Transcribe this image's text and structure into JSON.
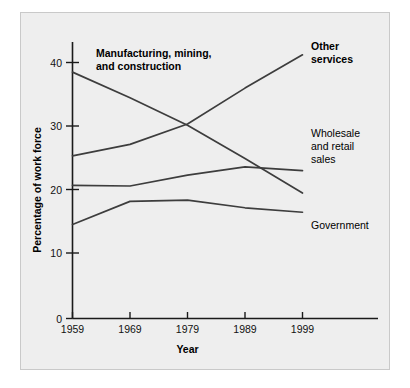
{
  "chart_data": {
    "type": "line",
    "title": "",
    "xlabel": "Year",
    "ylabel": "Percentage of work force",
    "categories": [
      "1959",
      "1969",
      "1979",
      "1989",
      "1999"
    ],
    "x": [
      1959,
      1969,
      1979,
      1989,
      1999
    ],
    "xlim": [
      1959,
      1999
    ],
    "ylim": [
      0,
      43
    ],
    "grid": false,
    "legend_position": "inline-annotations",
    "yticks": [
      "0",
      "10",
      "20",
      "30",
      "40"
    ],
    "ytick_values": [
      0,
      10,
      20,
      30,
      40
    ],
    "xticks": [
      "1959",
      "1969",
      "1979",
      "1989",
      "1999"
    ],
    "series": [
      {
        "name": "Manufacturing, mining, and construction",
        "label_bold": true,
        "values": [
          38.5,
          34.5,
          30.2,
          25.0,
          19.6
        ]
      },
      {
        "name": "Other services",
        "label_bold": true,
        "values": [
          25.4,
          27.2,
          30.4,
          36.0,
          41.2
        ]
      },
      {
        "name": "Wholesale and retail sales",
        "label_bold": false,
        "values": [
          20.8,
          20.7,
          22.4,
          23.7,
          23.1
        ]
      },
      {
        "name": "Government",
        "label_bold": false,
        "values": [
          14.7,
          18.3,
          18.5,
          17.3,
          16.6
        ]
      }
    ],
    "annotations": [
      {
        "id": "manufacturing",
        "line1": "Manufacturing, mining,",
        "line2": "and construction",
        "bold": true
      },
      {
        "id": "other-services",
        "line1": "Other",
        "line2": "services",
        "bold": true
      },
      {
        "id": "wholesale",
        "line1": "Wholesale",
        "line2": "and retail",
        "line3": "sales",
        "bold": false
      },
      {
        "id": "government",
        "line1": "Government",
        "bold": false
      }
    ],
    "colors": {
      "line": "#3d3d3d",
      "axis": "#1a1a1a",
      "plate_background": "#eeeeee",
      "page_background": "#ffffff",
      "text": "#000000"
    }
  }
}
